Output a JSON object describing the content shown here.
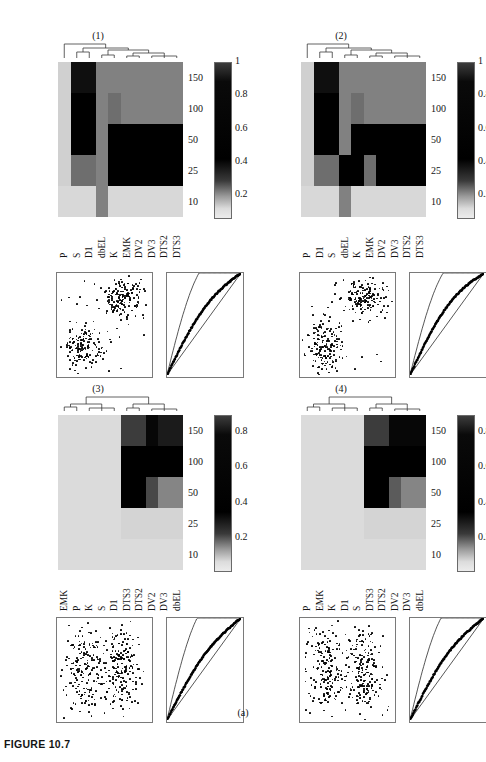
{
  "figure": {
    "caption": "FIGURE 10.7",
    "sublabel": "(a)"
  },
  "colors": {
    "dark": "#000000",
    "mid_dark": "#2a2a2a",
    "mid": "#606060",
    "mid_light": "#8f8f8f",
    "light": "#c8c8c8",
    "very_light": "#dcdcdc",
    "pale": "#e4e4e4",
    "axis": "#7a7a7a"
  },
  "panels": [
    {
      "id": "panel-1",
      "title": "(1)",
      "xlabels": [
        "P",
        "S",
        "D1",
        "dbEL",
        "K",
        "EMK",
        "DV2",
        "DV3",
        "DTS2",
        "DTS3"
      ],
      "yticks": [
        "150",
        "100",
        "50",
        "25",
        "10"
      ],
      "colorbar_labels": [
        "1",
        "0.8",
        "0.6",
        "0.4",
        "0.2"
      ],
      "colorbar_max": "1",
      "chart_data": {
        "type": "heatmap",
        "title": "(1)",
        "xlabel": "",
        "ylabel": "",
        "x_categories": [
          "P",
          "S",
          "D1",
          "dbEL",
          "K",
          "EMK",
          "DV2",
          "DV3",
          "DTS2",
          "DTS3"
        ],
        "y_categories": [
          "150",
          "100",
          "50",
          "25",
          "10"
        ],
        "zlim": [
          0.1,
          1.0
        ],
        "values": [
          [
            0.22,
            0.95,
            0.95,
            0.55,
            0.55,
            0.55,
            0.55,
            0.55,
            0.55,
            0.55
          ],
          [
            0.22,
            1.0,
            1.0,
            0.55,
            0.62,
            0.55,
            0.55,
            0.55,
            0.55,
            0.55
          ],
          [
            0.22,
            1.0,
            1.0,
            0.55,
            1.0,
            1.0,
            1.0,
            1.0,
            1.0,
            1.0
          ],
          [
            0.22,
            0.62,
            0.62,
            0.55,
            1.0,
            1.0,
            1.0,
            1.0,
            1.0,
            1.0
          ],
          [
            0.18,
            0.18,
            0.18,
            0.55,
            0.18,
            0.18,
            0.18,
            0.18,
            0.18,
            0.18
          ]
        ]
      }
    },
    {
      "id": "panel-2",
      "title": "(2)",
      "xlabels": [
        "P",
        "D1",
        "S",
        "dbEL",
        "K",
        "EMK",
        "DV2",
        "DV3",
        "DTS2",
        "DTS3"
      ],
      "yticks": [
        "150",
        "100",
        "50",
        "25",
        "10"
      ],
      "colorbar_labels": [
        "1",
        "0.8",
        "0.6",
        "0.4",
        "0.2"
      ],
      "colorbar_max": "1",
      "chart_data": {
        "type": "heatmap",
        "title": "(2)",
        "xlabel": "",
        "ylabel": "",
        "x_categories": [
          "P",
          "D1",
          "S",
          "dbEL",
          "K",
          "EMK",
          "DV2",
          "DV3",
          "DTS2",
          "DTS3"
        ],
        "y_categories": [
          "150",
          "100",
          "50",
          "25",
          "10"
        ],
        "zlim": [
          0.1,
          1.0
        ],
        "values": [
          [
            0.22,
            0.95,
            0.95,
            0.55,
            0.55,
            0.55,
            0.55,
            0.55,
            0.55,
            0.55
          ],
          [
            0.22,
            1.0,
            1.0,
            0.55,
            0.62,
            0.55,
            0.55,
            0.55,
            0.55,
            0.55
          ],
          [
            0.22,
            1.0,
            1.0,
            0.55,
            1.0,
            1.0,
            1.0,
            1.0,
            1.0,
            1.0
          ],
          [
            0.22,
            0.62,
            0.62,
            1.0,
            1.0,
            0.62,
            1.0,
            1.0,
            1.0,
            1.0
          ],
          [
            0.18,
            0.18,
            0.18,
            0.55,
            0.18,
            0.18,
            0.18,
            0.18,
            0.18,
            0.18
          ]
        ]
      }
    },
    {
      "id": "panel-3",
      "title": "(3)",
      "xlabels": [
        "EMK",
        "P",
        "K",
        "S",
        "D1",
        "DTS3",
        "DTS2",
        "DV2",
        "DV3",
        "dbEL"
      ],
      "yticks": [
        "150",
        "100",
        "50",
        "25",
        "10"
      ],
      "colorbar_labels": [
        "0.8",
        "0.6",
        "0.4",
        "0.2"
      ],
      "colorbar_max": "",
      "chart_data": {
        "type": "heatmap",
        "title": "(3)",
        "xlabel": "",
        "ylabel": "",
        "x_categories": [
          "EMK",
          "P",
          "K",
          "S",
          "D1",
          "DTS3",
          "DTS2",
          "DV2",
          "DV3",
          "dbEL"
        ],
        "y_categories": [
          "150",
          "100",
          "50",
          "25",
          "10"
        ],
        "zlim": [
          0.1,
          0.9
        ],
        "values": [
          [
            0.15,
            0.15,
            0.15,
            0.15,
            0.15,
            0.72,
            0.72,
            0.88,
            0.82,
            0.82
          ],
          [
            0.15,
            0.15,
            0.15,
            0.15,
            0.15,
            0.9,
            0.9,
            0.9,
            0.9,
            0.9
          ],
          [
            0.15,
            0.15,
            0.15,
            0.15,
            0.15,
            0.9,
            0.9,
            0.68,
            0.48,
            0.48
          ],
          [
            0.15,
            0.15,
            0.15,
            0.15,
            0.15,
            0.18,
            0.18,
            0.18,
            0.18,
            0.18
          ],
          [
            0.15,
            0.15,
            0.15,
            0.15,
            0.15,
            0.15,
            0.15,
            0.15,
            0.15,
            0.15
          ]
        ]
      }
    },
    {
      "id": "panel-4",
      "title": "(4)",
      "xlabels": [
        "P",
        "EMK",
        "K",
        "D1",
        "S",
        "DTS3",
        "DTS2",
        "DV2",
        "DV3",
        "dbEL"
      ],
      "yticks": [
        "150",
        "100",
        "50",
        "25",
        "10"
      ],
      "colorbar_labels": [
        "0.8",
        "0.6",
        "0.4",
        "0.2"
      ],
      "colorbar_max": "",
      "chart_data": {
        "type": "heatmap",
        "title": "(4)",
        "xlabel": "",
        "ylabel": "",
        "x_categories": [
          "P",
          "EMK",
          "K",
          "D1",
          "S",
          "DTS3",
          "DTS2",
          "DV2",
          "DV3",
          "dbEL"
        ],
        "y_categories": [
          "150",
          "100",
          "50",
          "25",
          "10"
        ],
        "zlim": [
          0.1,
          0.9
        ],
        "values": [
          [
            0.15,
            0.15,
            0.15,
            0.15,
            0.15,
            0.72,
            0.72,
            0.88,
            0.88,
            0.88
          ],
          [
            0.15,
            0.15,
            0.15,
            0.15,
            0.15,
            0.9,
            0.9,
            0.9,
            0.9,
            0.9
          ],
          [
            0.15,
            0.15,
            0.15,
            0.15,
            0.15,
            0.9,
            0.9,
            0.62,
            0.48,
            0.48
          ],
          [
            0.15,
            0.15,
            0.15,
            0.15,
            0.15,
            0.18,
            0.18,
            0.18,
            0.18,
            0.18
          ],
          [
            0.15,
            0.15,
            0.15,
            0.15,
            0.15,
            0.15,
            0.15,
            0.15,
            0.15,
            0.15
          ]
        ]
      }
    }
  ],
  "scatter_plots": [
    {
      "id": "scatter-1",
      "chart_data": {
        "type": "scatter",
        "title": "",
        "xlabel": "",
        "ylabel": "",
        "xlim": [
          0,
          1
        ],
        "ylim": [
          0,
          1
        ],
        "grid": false,
        "clusters": [
          {
            "name": "lower-left",
            "cx": 0.28,
            "cy": 0.28,
            "sx": 0.11,
            "sy": 0.12,
            "n": 150
          },
          {
            "name": "upper-right",
            "cx": 0.7,
            "cy": 0.76,
            "sx": 0.1,
            "sy": 0.09,
            "n": 150
          }
        ],
        "noise_points": 18
      }
    },
    {
      "id": "scatter-2",
      "chart_data": {
        "type": "scatter",
        "title": "",
        "xlabel": "",
        "ylabel": "",
        "xlim": [
          0,
          1
        ],
        "ylim": [
          0,
          1
        ],
        "grid": false,
        "clusters": [
          {
            "name": "lower-left",
            "cx": 0.26,
            "cy": 0.27,
            "sx": 0.09,
            "sy": 0.14,
            "n": 160
          },
          {
            "name": "upper-right",
            "cx": 0.68,
            "cy": 0.76,
            "sx": 0.11,
            "sy": 0.1,
            "n": 150
          }
        ],
        "noise_points": 20
      }
    },
    {
      "id": "scatter-3",
      "chart_data": {
        "type": "scatter",
        "title": "",
        "xlabel": "",
        "ylabel": "",
        "xlim": [
          0,
          1
        ],
        "ylim": [
          0,
          1
        ],
        "grid": false,
        "clusters": [
          {
            "name": "left-band",
            "cx": 0.3,
            "cy": 0.5,
            "sx": 0.1,
            "sy": 0.22,
            "n": 180
          },
          {
            "name": "right-band",
            "cx": 0.68,
            "cy": 0.52,
            "sx": 0.09,
            "sy": 0.21,
            "n": 180
          }
        ],
        "noise_points": 22
      }
    },
    {
      "id": "scatter-4",
      "chart_data": {
        "type": "scatter",
        "title": "",
        "xlabel": "",
        "ylabel": "",
        "xlim": [
          0,
          1
        ],
        "ylim": [
          0,
          1
        ],
        "grid": false,
        "clusters": [
          {
            "name": "left-band",
            "cx": 0.29,
            "cy": 0.5,
            "sx": 0.1,
            "sy": 0.23,
            "n": 180
          },
          {
            "name": "right-band",
            "cx": 0.67,
            "cy": 0.5,
            "sx": 0.09,
            "sy": 0.22,
            "n": 180
          }
        ],
        "noise_points": 22
      }
    }
  ],
  "curve_plots": [
    {
      "id": "curve-1",
      "chart_data": {
        "type": "line",
        "title": "",
        "xlabel": "",
        "ylabel": "",
        "xlim": [
          0,
          1
        ],
        "ylim": [
          0,
          1
        ],
        "grid": false,
        "series": [
          {
            "name": "upper-envelope",
            "curvature": 0.62
          },
          {
            "name": "diagonal-reference",
            "curvature": 0.0
          },
          {
            "name": "empirical-band",
            "curvature": 0.16
          }
        ]
      }
    },
    {
      "id": "curve-2",
      "chart_data": {
        "type": "line",
        "title": "",
        "xlabel": "",
        "ylabel": "",
        "xlim": [
          0,
          1
        ],
        "ylim": [
          0,
          1
        ],
        "grid": false,
        "series": [
          {
            "name": "upper-envelope",
            "curvature": 0.6
          },
          {
            "name": "diagonal-reference",
            "curvature": 0.0
          },
          {
            "name": "empirical-band",
            "curvature": 0.18
          }
        ]
      }
    },
    {
      "id": "curve-3",
      "chart_data": {
        "type": "line",
        "title": "",
        "xlabel": "",
        "ylabel": "",
        "xlim": [
          0,
          1
        ],
        "ylim": [
          0,
          1
        ],
        "grid": false,
        "series": [
          {
            "name": "upper-envelope",
            "curvature": 0.66
          },
          {
            "name": "diagonal-reference",
            "curvature": 0.0
          },
          {
            "name": "empirical-band",
            "curvature": 0.14
          }
        ]
      }
    },
    {
      "id": "curve-4",
      "chart_data": {
        "type": "line",
        "title": "",
        "xlabel": "",
        "ylabel": "",
        "xlim": [
          0,
          1
        ],
        "ylim": [
          0,
          1
        ],
        "grid": false,
        "series": [
          {
            "name": "upper-envelope",
            "curvature": 0.64
          },
          {
            "name": "diagonal-reference",
            "curvature": 0.0
          },
          {
            "name": "empirical-band",
            "curvature": 0.15
          }
        ]
      }
    }
  ]
}
